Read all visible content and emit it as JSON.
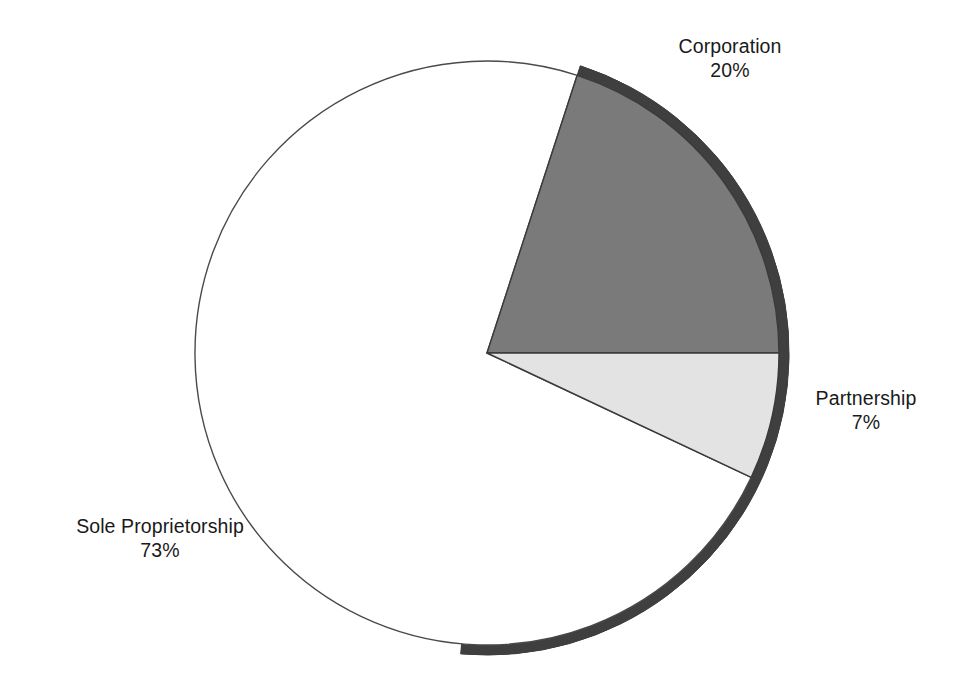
{
  "chart_data": {
    "type": "pie",
    "title": "",
    "subtitle": "",
    "xlabel": "",
    "ylabel": "",
    "grid": false,
    "legend_position": "none",
    "labels_position": "outside-callout",
    "start_angle_deg": 18,
    "direction": "clockwise",
    "categories": [
      "Corporation",
      "Partnership",
      "Sole Proprietorship"
    ],
    "values": [
      20,
      7,
      73
    ],
    "value_unit": "percent",
    "value_labels": [
      "20%",
      "7%",
      "73%"
    ],
    "slices": [
      {
        "name": "Corporation",
        "value": 20,
        "value_label": "20%",
        "color": "#7a7a7a",
        "start_angle_deg": 18,
        "end_angle_deg": 90
      },
      {
        "name": "Partnership",
        "value": 7,
        "value_label": "7%",
        "color": "#e3e3e3",
        "start_angle_deg": 90,
        "end_angle_deg": 115.2
      },
      {
        "name": "Sole Proprietorship",
        "value": 73,
        "value_label": "73%",
        "color": "#ffffff",
        "start_angle_deg": 115.2,
        "end_angle_deg": 378
      }
    ]
  },
  "colors": {
    "background": "#ffffff",
    "outline": "#4a4a4a",
    "shadow_ring": "#3f3f3f",
    "corporation_fill": "#7a7a7a",
    "partnership_fill": "#e3e3e3",
    "sole_proprietorship_fill": "#ffffff",
    "label_text": "#1a1a1a"
  },
  "labels": {
    "corporation": {
      "name": "Corporation",
      "percent": "20%"
    },
    "partnership": {
      "name": "Partnership",
      "percent": "7%"
    },
    "sole_proprietorship": {
      "name": "Sole Proprietorship",
      "percent": "73%"
    }
  }
}
